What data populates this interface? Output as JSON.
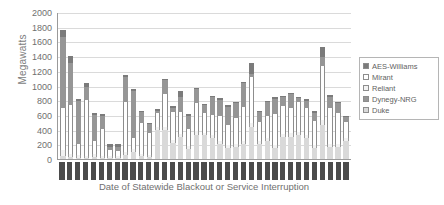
{
  "chart_data": {
    "type": "bar",
    "subtype": "stacked-column",
    "title": "",
    "xlabel": "Date of Statewide Blackout or Service Interruption",
    "ylabel": "Megawatts",
    "ylim": [
      0,
      2000
    ],
    "ytick_values": [
      2000,
      1800,
      1600,
      1400,
      1200,
      1000,
      800,
      600,
      400,
      200,
      0
    ],
    "ytick_labels": [
      "2000",
      "1800",
      "1600",
      "1400",
      "1200",
      "1000",
      "800",
      "600",
      "400",
      "200",
      "0"
    ],
    "grid": true,
    "grid_axis": "y",
    "legend_position": "right",
    "legend_entries": [
      "AES-Williams",
      "Mirant",
      "Reliant",
      "Dynegy-NRG",
      "Duke"
    ],
    "series_colors": {
      "AES-Williams": "#7b7b7b",
      "Mirant": "#ffffff",
      "Reliant": "#f2f2f2",
      "Dynegy-NRG": "#969696",
      "Duke": "#d9d9d9"
    },
    "categories": [
      "1",
      "2",
      "3",
      "4",
      "5",
      "6",
      "7",
      "8",
      "9",
      "10",
      "11",
      "12",
      "13",
      "14",
      "15",
      "16",
      "17",
      "18",
      "19",
      "20",
      "21",
      "22",
      "23",
      "24",
      "25",
      "26",
      "27",
      "28",
      "29",
      "30",
      "31",
      "32",
      "33",
      "34",
      "35",
      "36",
      "37"
    ],
    "category_tick_style": "dark rotated date labels (illegible at this resolution)",
    "series": [
      {
        "name": "Duke",
        "color": "#d9d9d9",
        "values": [
          40,
          30,
          20,
          20,
          30,
          20,
          20,
          20,
          60,
          100,
          40,
          30,
          400,
          400,
          220,
          300,
          140,
          330,
          320,
          280,
          200,
          150,
          160,
          200,
          430,
          200,
          250,
          150,
          300,
          300,
          330,
          280,
          150,
          460,
          170,
          160,
          250
        ]
      },
      {
        "name": "Dynegy-NRG",
        "color": "#969696",
        "values": [
          960,
          580,
          580,
          180,
          350,
          180,
          40,
          60,
          340,
          640,
          150,
          120,
          30,
          180,
          60,
          200,
          180,
          190,
          110,
          240,
          230,
          250,
          200,
          320,
          50,
          140,
          180,
          210,
          120,
          190,
          60,
          100,
          110,
          120,
          150,
          130,
          60
        ]
      },
      {
        "name": "Reliant",
        "color": "#f2f2f2",
        "values": [
          80,
          40,
          30,
          20,
          40,
          20,
          20,
          20,
          30,
          40,
          30,
          20,
          30,
          40,
          40,
          40,
          40,
          50,
          40,
          40,
          40,
          40,
          40,
          50,
          60,
          40,
          40,
          40,
          40,
          50,
          40,
          40,
          40,
          70,
          40,
          40,
          40
        ]
      },
      {
        "name": "Mirant",
        "color": "#ffffff",
        "values": [
          580,
          660,
          160,
          760,
          180,
          370,
          80,
          70,
          680,
          150,
          420,
          300,
          200,
          450,
          380,
          300,
          230,
          380,
          260,
          280,
          340,
          270,
          360,
          460,
          620,
          260,
          300,
          420,
          380,
          340,
          400,
          370,
          330,
          740,
          490,
          430,
          220
        ]
      },
      {
        "name": "AES-Williams",
        "color": "#7b7b7b",
        "values": [
          100,
          90,
          20,
          60,
          20,
          20,
          50,
          30,
          30,
          20,
          20,
          20,
          20,
          20,
          20,
          90,
          20,
          20,
          20,
          20,
          20,
          20,
          20,
          20,
          140,
          20,
          20,
          20,
          20,
          20,
          20,
          20,
          20,
          130,
          20,
          20,
          20
        ]
      }
    ],
    "totals": [
      1760,
      1400,
      810,
      1040,
      620,
      610,
      210,
      200,
      1140,
      950,
      660,
      490,
      680,
      1090,
      720,
      930,
      610,
      970,
      750,
      860,
      830,
      730,
      780,
      1050,
      1300,
      660,
      790,
      840,
      860,
      900,
      850,
      810,
      650,
      1520,
      870,
      780,
      590
    ]
  }
}
